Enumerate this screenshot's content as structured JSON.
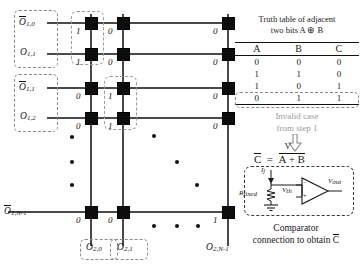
{
  "diagram": {
    "row_labels": [
      {
        "text": "O",
        "sub": "1,0",
        "overbar": true
      },
      {
        "text": "O",
        "sub": "1,1",
        "overbar": false
      },
      {
        "text": "O",
        "sub": "1,1",
        "overbar": true
      },
      {
        "text": "O",
        "sub": "1,2",
        "overbar": false
      },
      {
        "text": "O",
        "sub": "1,N-1",
        "overbar": true
      }
    ],
    "column_labels": [
      {
        "text": "O",
        "sub": "2,0",
        "overbar": false
      },
      {
        "text": "O",
        "sub": "2,1",
        "overbar": false
      },
      {
        "text": "O",
        "sub": "2,N-1",
        "overbar": false
      }
    ],
    "cell_values": {
      "col0": [
        "1",
        "1",
        "0",
        "0",
        "0"
      ],
      "col1": [
        "0",
        "0",
        "1",
        "1",
        "0"
      ],
      "col2": [
        "0",
        "0",
        "0",
        "0",
        "1"
      ]
    },
    "ellipsis_note": "vertical and diagonal dot ellipses indicate continuation"
  },
  "truth_table": {
    "title_line1": "Truth table of adjacent",
    "title_line2": "two bits A ⊕ B",
    "headers": [
      "A",
      "B",
      "C"
    ],
    "rows": [
      [
        "0",
        "0",
        "0"
      ],
      [
        "1",
        "1",
        "0"
      ],
      [
        "1",
        "0",
        "1"
      ],
      [
        "0",
        "1",
        "1"
      ]
    ],
    "highlighted_row_index": 3
  },
  "annotation": {
    "invalid_line1": "Invalid case",
    "invalid_line2": "from step 1",
    "arrow_icon": "down-arrow-icon"
  },
  "equation": {
    "lhs": "C",
    "lhs_overbar": true,
    "rhs": "A + B",
    "or_symbol": "V",
    "full": "C̅ = A̅ + B̅"
  },
  "comparator": {
    "current_label": "I",
    "current_sub": "j",
    "resistor_label": "R",
    "resistor_sub": "fixed",
    "vin_label": "V",
    "vin_sub": "th",
    "vout_label": "V",
    "vout_sub": "out",
    "plus_sign": "+",
    "minus_sign": "−",
    "ground_icon": "ground-icon",
    "opamp_icon": "comparator-triangle-icon"
  },
  "caption": {
    "line1": "Comparator",
    "line2_pre": "connection to obtain ",
    "line2_var": "C"
  },
  "colors": {
    "wire": "#4a4a4a",
    "node": "#0d0d0d",
    "dashed_highlight": "#8a8a8a",
    "gray_text": "#9b9b9b",
    "text": "#1a1a1a"
  }
}
